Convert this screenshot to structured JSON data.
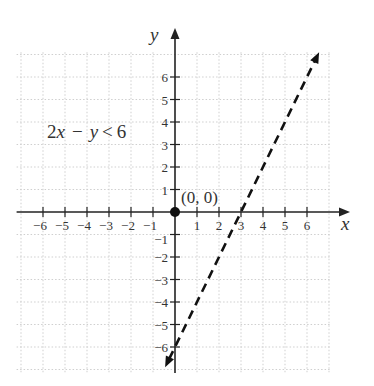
{
  "chart_data": {
    "type": "line",
    "title": "",
    "inequality": "2x − y < 6",
    "inequality_parts": {
      "a": "2",
      "x": "x",
      "op1": "−",
      "y": "y",
      "op2": "<",
      "c": "6"
    },
    "boundary_line": {
      "equation": "2x - y = 6",
      "slope": 2,
      "intercept": -6,
      "style": "dashed",
      "x_range": [
        -0.45,
        6.55
      ],
      "arrows": "both"
    },
    "test_point": {
      "x": 0,
      "y": 0,
      "label": "(0, 0)"
    },
    "xlabel": "x",
    "ylabel": "y",
    "xlim": [
      -7.2,
      7.6
    ],
    "ylim": [
      -7.1,
      8.1
    ],
    "x_ticks": [
      -6,
      -5,
      -4,
      -3,
      -2,
      -1,
      1,
      2,
      3,
      4,
      5,
      6
    ],
    "y_ticks": [
      -6,
      -5,
      -4,
      -3,
      -2,
      -1,
      1,
      2,
      3,
      4,
      5,
      6
    ],
    "x_tick_labels": [
      "−6",
      "−5",
      "−4",
      "−3",
      "−2",
      "−1",
      "1",
      "2",
      "3",
      "4",
      "5",
      "6"
    ],
    "y_tick_labels": [
      "−6",
      "−5",
      "−4",
      "−3",
      "−2",
      "−1",
      "1",
      "2",
      "3",
      "4",
      "5",
      "6"
    ],
    "grid": true,
    "grid_style": "dotted",
    "grid_range": {
      "x": [
        -7,
        7
      ],
      "y": [
        -7,
        7
      ]
    },
    "legend": null
  },
  "colors": {
    "axis": "#222222",
    "line": "#111111",
    "grid": "#cfcfcf",
    "text": "#333333"
  }
}
